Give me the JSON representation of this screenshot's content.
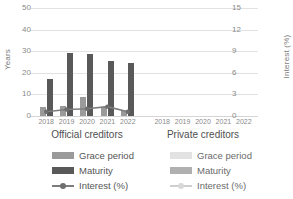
{
  "chart_data": {
    "type": "bar",
    "title": "",
    "ylabel": "Years",
    "y2label": "Interest (%)",
    "xlabel": "",
    "ylim": [
      0,
      50
    ],
    "y2lim": [
      0,
      15
    ],
    "yticks": [
      "0",
      "10",
      "20",
      "30",
      "40",
      "50"
    ],
    "y2ticks": [
      "0",
      "3",
      "6",
      "9",
      "12",
      "15"
    ],
    "grid": true,
    "legend_position": "bottom",
    "panels": [
      {
        "name": "Official creditors",
        "categories": [
          "2018",
          "2019",
          "2020",
          "2021",
          "2022"
        ],
        "series": [
          {
            "name": "Grace period",
            "unit": "Years",
            "axis": "left",
            "values": [
              4.0,
              4.6,
              8.9,
              4.2,
              2.1
            ]
          },
          {
            "name": "Maturity",
            "unit": "Years",
            "axis": "left",
            "values": [
              17.2,
              29.0,
              28.9,
              25.4,
              24.6
            ]
          },
          {
            "name": "Interest (%)",
            "unit": "%",
            "axis": "right",
            "values": [
              0.6,
              0.9,
              1.0,
              1.3,
              0.6
            ]
          }
        ]
      },
      {
        "name": "Private creditors",
        "categories": [
          "2018",
          "2019",
          "2020",
          "2021",
          "2022"
        ],
        "series": [
          {
            "name": "Grace period",
            "unit": "Years",
            "axis": "left",
            "values": [
              null,
              null,
              null,
              null,
              null
            ]
          },
          {
            "name": "Maturity",
            "unit": "Years",
            "axis": "left",
            "values": [
              null,
              null,
              null,
              null,
              null
            ]
          },
          {
            "name": "Interest (%)",
            "unit": "%",
            "axis": "right",
            "values": [
              null,
              null,
              null,
              null,
              null
            ]
          }
        ]
      }
    ]
  },
  "axes": {
    "left_title": "Years",
    "right_title": "Interest (%)"
  },
  "panels": {
    "official": {
      "title": "Official creditors"
    },
    "private": {
      "title": "Private creditors"
    }
  },
  "legend": {
    "official": {
      "grace": "Grace period",
      "maturity": "Maturity",
      "interest": "Interest (%)"
    },
    "private": {
      "grace": "Grace period",
      "maturity": "Maturity",
      "interest": "Interest (%)"
    }
  },
  "colors": {
    "grace": "#9a9a9a",
    "maturity": "#595959",
    "interest_line": "#7d7d7d",
    "grace_light": "#e0e0e0",
    "maturity_light": "#b5b5b5",
    "interest_line_light": "#d2d2d2",
    "gridline": "#e2e2e2",
    "text": "#8a8a8a"
  }
}
